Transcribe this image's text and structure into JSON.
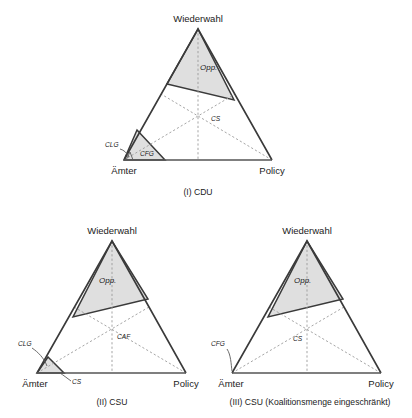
{
  "figure": {
    "title": "",
    "background_color": "#ffffff",
    "shade_color": "#dcdcdc",
    "line_color": "#3a3a3a",
    "dash_color": "#9b9b9b"
  },
  "panels": [
    {
      "id": "panel-1",
      "caption": "(I) CDU",
      "vertices": {
        "top": "Wiederwahl",
        "left": "Ämter",
        "right": "Policy"
      },
      "regions": [
        {
          "name": "Opp.",
          "label": "Opp."
        },
        {
          "name": "CFG",
          "label": "CFG"
        }
      ],
      "annotations": [
        {
          "name": "CLG",
          "label": "CLG"
        },
        {
          "name": "CS",
          "label": "CS"
        }
      ]
    },
    {
      "id": "panel-2",
      "caption": "(II) CSU",
      "vertices": {
        "top": "Wiederwahl",
        "left": "Ämter",
        "right": "Policy"
      },
      "regions": [
        {
          "name": "Opp.",
          "label": "Opp."
        }
      ],
      "annotations": [
        {
          "name": "CLG",
          "label": "CLG"
        },
        {
          "name": "CS",
          "label": "CS"
        },
        {
          "name": "CAF",
          "label": "CAF"
        }
      ]
    },
    {
      "id": "panel-3",
      "caption": "(III) CSU (Koalitionsmenge eingeschränkt)",
      "vertices": {
        "top": "Wiederwahl",
        "left": "Ämter",
        "right": "Policy"
      },
      "regions": [
        {
          "name": "Opp.",
          "label": "Opp."
        }
      ],
      "annotations": [
        {
          "name": "CFG",
          "label": "CFG"
        },
        {
          "name": "CS",
          "label": "CS"
        }
      ]
    }
  ]
}
